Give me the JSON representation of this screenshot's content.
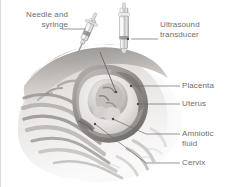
{
  "figure": {
    "background_color": "#ffffff",
    "label_text_color": "#6e6e6e",
    "leader_line_color": "#6a6a6a"
  },
  "labels": [
    {
      "id": "needle-and-syringe",
      "text": "Needle and\nsyringe",
      "align": "right",
      "x": 6,
      "y": 10,
      "width": 62
    },
    {
      "id": "ultrasound-transducer",
      "text": "Ultrasound\ntransducer",
      "align": "left",
      "x": 160,
      "y": 20,
      "width": 64
    },
    {
      "id": "placenta",
      "text": "Placenta",
      "align": "left",
      "x": 182,
      "y": 85,
      "width": 44
    },
    {
      "id": "uterus",
      "text": "Uterus",
      "align": "left",
      "x": 182,
      "y": 103,
      "width": 44
    },
    {
      "id": "amniotic-fluid",
      "text": "Amniotic\nfluid",
      "align": "left",
      "x": 182,
      "y": 131,
      "width": 44
    },
    {
      "id": "cervix",
      "text": "Cervix",
      "align": "left",
      "x": 182,
      "y": 160,
      "width": 44
    }
  ],
  "leader_lines": [
    {
      "id": "leader-needle-and-syringe",
      "points": "62,29 86,29"
    },
    {
      "id": "leader-ultrasound-transducer",
      "points": "131,39 158,39"
    },
    {
      "id": "leader-placenta",
      "points": "131,86 180,86"
    },
    {
      "id": "leader-uterus",
      "points": "138,104 180,104"
    },
    {
      "id": "leader-amniotic-fluid",
      "points": "113,119 146,134 180,134"
    },
    {
      "id": "leader-cervix",
      "points": "95,124 146,163 180,163"
    },
    {
      "id": "leader-needle-tip",
      "points": "85,32 116,92"
    }
  ],
  "anatomy_parts": [
    {
      "id": "maternal-abdomen",
      "label": "Maternal abdomen cross-section"
    },
    {
      "id": "abdominal-wall-layers",
      "label": "Abdominal wall layers"
    },
    {
      "id": "uterus-wall",
      "label": "Uterine wall"
    },
    {
      "id": "placenta-mass",
      "label": "Placenta"
    },
    {
      "id": "amniotic-sac",
      "label": "Amniotic sac with fluid"
    },
    {
      "id": "fetus",
      "label": "Fetus"
    },
    {
      "id": "cervix-canal",
      "label": "Cervix"
    }
  ],
  "instruments": [
    {
      "id": "syringe",
      "label": "Needle and syringe"
    },
    {
      "id": "transducer",
      "label": "Ultrasound transducer"
    }
  ],
  "colors": {
    "skin_light": "#f3f1f0",
    "skin_mid": "#dddad8",
    "skin_shadow": "#b9b5b2",
    "tissue_dark": "#8d8a87",
    "uterus_outline": "#5e5b58",
    "fluid": "#e9e7e5",
    "fetus": "#cfcac6",
    "metal_light": "#efefef",
    "metal_dark": "#9b9b9b"
  }
}
